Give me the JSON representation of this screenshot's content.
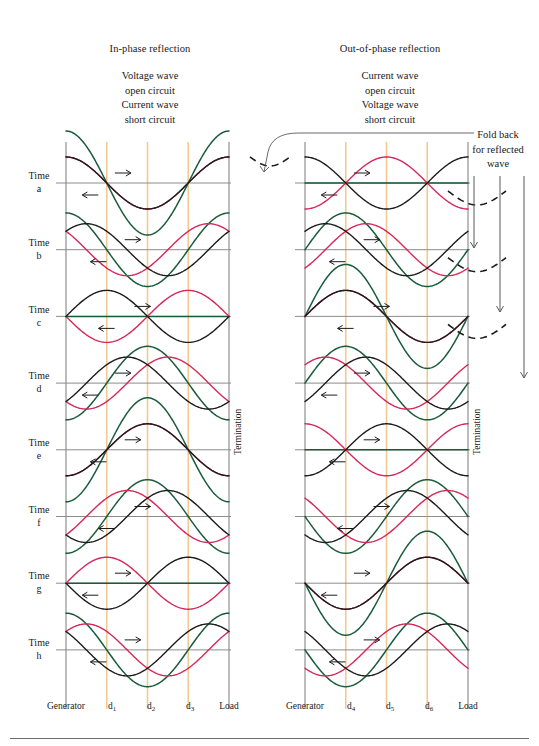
{
  "figure": {
    "width": 539,
    "height": 746,
    "background": "#ffffff"
  },
  "colors": {
    "incident_wave": "#1c1c1c",
    "reflected_wave": "#d6285a",
    "resultant_wave": "#1a5c3a",
    "gridline": "#f2c992",
    "baseline": "#8c8c8c",
    "frame": "#7a7a7a",
    "text": "#1a1a1a",
    "foldback_dashed": "#1c1c1c"
  },
  "panels": [
    {
      "id": "in-phase",
      "title": "In-phase reflection",
      "caption_lines": [
        "Voltage wave",
        "open circuit",
        "Current wave",
        "short circuit"
      ],
      "termination_label": "Termination",
      "axis_labels": [
        "Generator",
        "d",
        "d",
        "d",
        "Load"
      ],
      "axis_subscripts": [
        "",
        "1",
        "2",
        "3",
        ""
      ],
      "reflection_sign": "+1"
    },
    {
      "id": "out-of-phase",
      "title": "Out-of-phase reflection",
      "caption_lines": [
        "Current wave",
        "open circuit",
        "Voltage wave",
        "short circuit"
      ],
      "termination_label": "Termination",
      "axis_labels": [
        "Generator",
        "d",
        "d",
        "d",
        "Load"
      ],
      "axis_subscripts": [
        "",
        "4",
        "5",
        "6",
        ""
      ],
      "reflection_sign": "-1"
    }
  ],
  "time_rows": [
    {
      "label": "Time",
      "letter": "a",
      "phase_fraction": 0.0
    },
    {
      "label": "Time",
      "letter": "b",
      "phase_fraction": 0.125
    },
    {
      "label": "Time",
      "letter": "c",
      "phase_fraction": 0.25
    },
    {
      "label": "Time",
      "letter": "d",
      "phase_fraction": 0.375
    },
    {
      "label": "Time",
      "letter": "e",
      "phase_fraction": 0.5
    },
    {
      "label": "Time",
      "letter": "f",
      "phase_fraction": 0.625
    },
    {
      "label": "Time",
      "letter": "g",
      "phase_fraction": 0.75
    },
    {
      "label": "Time",
      "letter": "h",
      "phase_fraction": 0.875
    }
  ],
  "annotation": {
    "foldback_lines": [
      "Fold back",
      "for reflected",
      "wave"
    ],
    "arrow_count": 3,
    "dashed_curve_count": 3,
    "leader_from": "foldback-label",
    "leader_to": "dashed-curve-row-a"
  },
  "chart_data": {
    "type": "line",
    "xlabel": "Distance along line",
    "ylabel": "Amplitude",
    "xlim": [
      0,
      1
    ],
    "ylim": [
      -2,
      2
    ],
    "grid": true,
    "legend_position": "none",
    "x_tick_labels": [
      "Generator",
      "d1",
      "d2",
      "d3",
      "Load"
    ],
    "x_tick_positions": [
      0.0,
      0.25,
      0.5,
      0.75,
      1.0
    ],
    "row_labels": [
      "Time a",
      "Time b",
      "Time c",
      "Time d",
      "Time e",
      "Time f",
      "Time g",
      "Time h"
    ],
    "series": [
      {
        "name": "Incident wave",
        "color": "#1c1c1c",
        "amplitude": 1,
        "direction": "toward load"
      },
      {
        "name": "Reflected wave",
        "color": "#d6285a",
        "amplitude": 1,
        "direction": "toward generator"
      },
      {
        "name": "Resultant standing wave",
        "color": "#1a5c3a",
        "amplitude": 2,
        "direction": "stationary"
      }
    ],
    "notes": [
      "Left panel: reflection coefficient +1 (in-phase); resultant is zero at Time b and Time f.",
      "Right panel: reflection coefficient -1 (out-of-phase); resultant is zero at Time d and Time h.",
      "Incident and reflected waves each complete one cycle over eight time steps a-h."
    ]
  }
}
